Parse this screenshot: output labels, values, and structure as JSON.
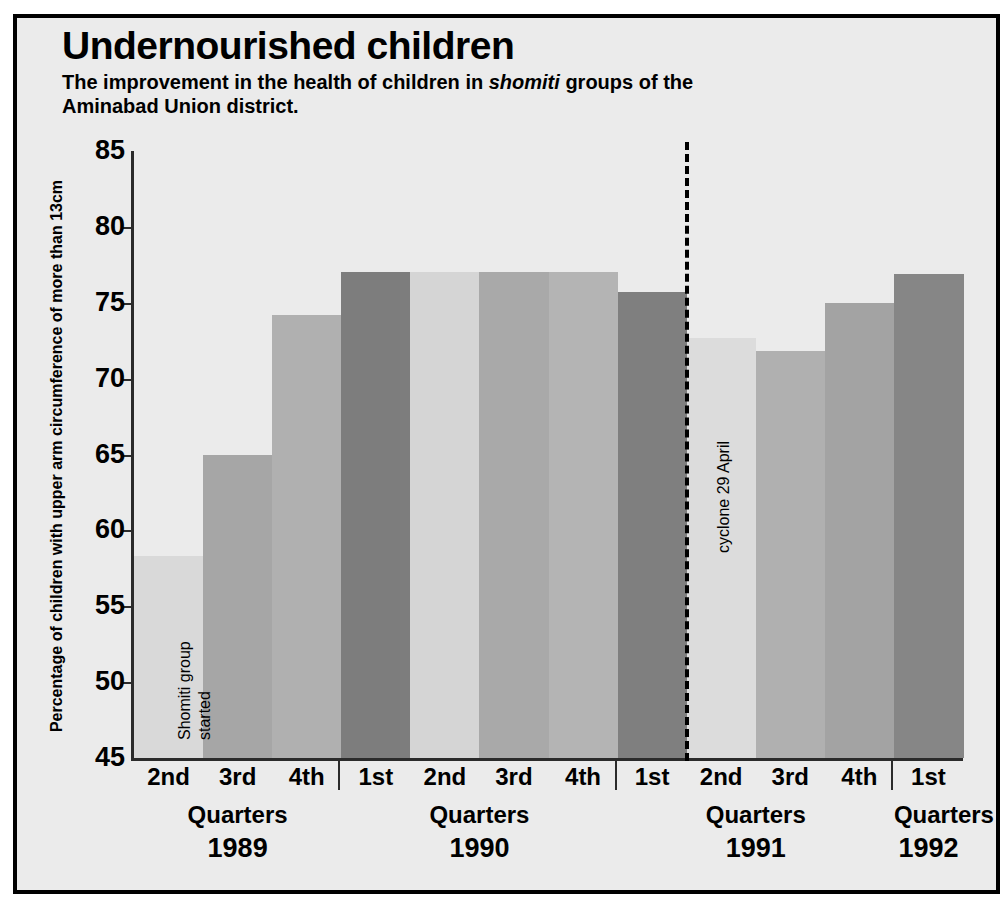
{
  "title": "Undernourished children",
  "subtitle_part1": "The improvement in the health of children in ",
  "subtitle_italic": "shomiti",
  "subtitle_part2": " groups of the Aminabad Union district.",
  "annotations": {
    "shomiti": "Shomiti group started",
    "cyclone": "cyclone 29 April"
  },
  "chart_data": {
    "type": "bar",
    "title": "Undernourished children",
    "subtitle": "The improvement in the health of children in shomiti groups of the Aminabad Union district.",
    "xlabel": "Quarters",
    "ylabel": "Percentage of children with upper arm circumference of more than 13cm",
    "ylim": [
      45,
      85
    ],
    "yticks": [
      45,
      50,
      55,
      60,
      65,
      70,
      75,
      80,
      85
    ],
    "ytick_labels": [
      "45",
      "50",
      "55",
      "60",
      "65",
      "70",
      "75",
      "80",
      "85"
    ],
    "grid": false,
    "legend": "none",
    "categories": [
      "2nd",
      "3rd",
      "4th",
      "1st",
      "2nd",
      "3rd",
      "4th",
      "1st",
      "2nd",
      "3rd",
      "4th",
      "1st"
    ],
    "years": [
      "1989",
      "1989",
      "1989",
      "1990",
      "1990",
      "1990",
      "1990",
      "1991",
      "1991",
      "1991",
      "1991",
      "1992"
    ],
    "values": [
      58.3,
      65.0,
      74.2,
      77.0,
      77.0,
      77.0,
      77.0,
      75.7,
      72.7,
      71.8,
      75.0,
      76.9
    ],
    "bar_colors": [
      "#d9d9d9",
      "#a6a6a6",
      "#b0b0b0",
      "#7d7d7d",
      "#d5d5d5",
      "#a9a9a9",
      "#b4b4b4",
      "#7f7f7f",
      "#dcdcdc",
      "#b0b0b0",
      "#a3a3a3",
      "#868686"
    ],
    "annotations": [
      {
        "text": "Shomiti group started",
        "at_category": 0
      },
      {
        "text": "cyclone 29 April",
        "at_boundary": "between 1st 1991 and 2nd 1991",
        "style": "dashed vertical line"
      }
    ],
    "year_groups": [
      {
        "year": "1989",
        "quarters": [
          "2nd",
          "3rd",
          "4th"
        ],
        "axis_label": "Quarters"
      },
      {
        "year": "1990",
        "quarters": [
          "1st",
          "2nd",
          "3rd",
          "4th"
        ],
        "axis_label": "Quarters"
      },
      {
        "year": "1991",
        "quarters": [
          "1st",
          "2nd",
          "3rd",
          "4th"
        ],
        "axis_label": "Quarters"
      },
      {
        "year": "1992",
        "quarters": [
          "1st"
        ],
        "axis_label": "Quarters"
      }
    ]
  }
}
